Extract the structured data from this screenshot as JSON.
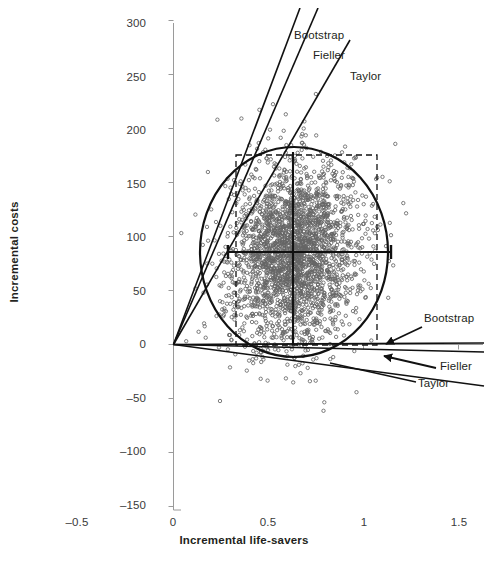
{
  "chart_data": {
    "type": "scatter",
    "title": "",
    "xlabel": "Incremental life-savers",
    "ylabel": "Incremental costs",
    "xlim": [
      -0.5,
      1.5
    ],
    "ylim": [
      -150,
      300
    ],
    "grid": false,
    "legend_position": "inline-annotations",
    "xticks": [
      "-0.5",
      "0",
      "0.5",
      "1",
      "1.5"
    ],
    "xtick_values": [
      -0.5,
      0,
      0.5,
      1,
      1.5
    ],
    "yticks": [
      "300",
      "250",
      "200",
      "150",
      "100",
      "50",
      "0",
      "-50",
      "-100",
      "-150"
    ],
    "ytick_values": [
      300,
      250,
      200,
      150,
      100,
      50,
      0,
      -50,
      -100,
      -150
    ],
    "point_count": 2500,
    "point_style": "open-circle",
    "point_color": "#6b6b6b",
    "point_radius": 1.7,
    "cloud_center": [
      0.63,
      85
    ],
    "cloud_sigma": [
      0.17,
      42
    ],
    "cloud_correlation": 0.12,
    "series": [
      {
        "name": "Bootstrap replicates",
        "type": "scatter",
        "description": "Bootstrap replicate cloud of incremental cost and incremental life-savers pairs"
      },
      {
        "name": "Bootstrap",
        "type": "ellipse",
        "description": "Bootstrap 95% confidence ellipse",
        "center": [
          0.63,
          85
        ],
        "semi_axis_x": 0.34,
        "semi_axis_y": 96
      },
      {
        "name": "Fieller",
        "type": "crosshair",
        "description": "Fieller confidence interval crosshair",
        "center": [
          0.63,
          85
        ],
        "x_interval": [
          0.29,
          1.14
        ],
        "y_interval": [
          -1,
          178
        ]
      },
      {
        "name": "Taylor",
        "type": "box",
        "description": "Taylor series confidence box (dashed)",
        "x_interval": [
          0.33,
          1.07
        ],
        "y_interval": [
          0,
          175
        ]
      }
    ],
    "cone_lines_upper": [
      {
        "name": "Bootstrap",
        "slope_label": "steepest",
        "origin": [
          0,
          0
        ]
      },
      {
        "name": "Fieller",
        "slope_label": "middle",
        "origin": [
          0,
          0
        ]
      },
      {
        "name": "Taylor",
        "slope_label": "shallowest",
        "origin": [
          0,
          0
        ]
      }
    ],
    "cone_lines_lower": [
      {
        "name": "Bootstrap",
        "origin": [
          0,
          0
        ]
      },
      {
        "name": "Fieller",
        "origin": [
          0,
          0
        ]
      },
      {
        "name": "Taylor",
        "origin": [
          0,
          0
        ]
      }
    ],
    "annotations": [
      {
        "text": "Bootstrap",
        "position": "upper",
        "x": 294,
        "y": 36
      },
      {
        "text": "Fieller",
        "position": "upper",
        "x": 313,
        "y": 56
      },
      {
        "text": "Taylor",
        "position": "upper",
        "x": 350,
        "y": 77
      },
      {
        "text": "Bootstrap",
        "position": "right",
        "x": 424,
        "y": 319
      },
      {
        "text": "Fieller",
        "position": "right",
        "x": 440,
        "y": 360
      },
      {
        "text": "Taylor",
        "position": "right",
        "x": 418,
        "y": 381
      }
    ]
  },
  "axes": {
    "x_title": "Incremental life-savers",
    "y_title": "Incremental costs"
  },
  "labels": {
    "y_300": "300",
    "y_250": "250",
    "y_200": "200",
    "y_150": "150",
    "y_100": "100",
    "y_50": "50",
    "y_0": "0",
    "y_m50": "–50",
    "y_m100": "–100",
    "y_m150": "–150",
    "x_m05": "–0.5",
    "x_0": "0",
    "x_05": "0.5",
    "x_1": "1",
    "x_15": "1.5",
    "ann_bootstrap_top": "Bootstrap",
    "ann_fieller_top": "Fieller",
    "ann_taylor_top": "Taylor",
    "ann_bootstrap_right": "Bootstrap",
    "ann_fieller_right": "Fieller",
    "ann_taylor_right": "Taylor"
  }
}
